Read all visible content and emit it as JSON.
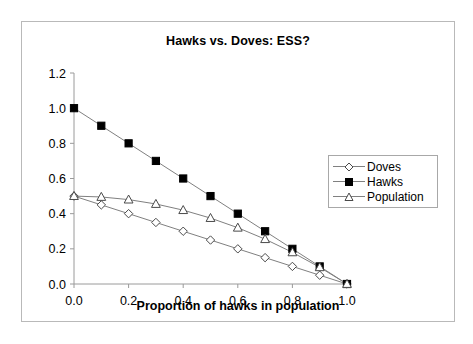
{
  "chart": {
    "title": "Hawks vs. Doves: ESS?",
    "xlabel": "Proportion of hawks in population",
    "ylabel": "",
    "x_ticks": [
      "0.0",
      "0.2",
      "0.4",
      "0.6",
      "0.8",
      "1.0"
    ],
    "y_ticks": [
      "0.0",
      "0.2",
      "0.4",
      "0.6",
      "0.8",
      "1.0",
      "1.2"
    ],
    "legend": {
      "position": "right-middle",
      "entries": [
        {
          "label": "Doves",
          "marker": "open-diamond-icon",
          "color": "#4a4a4a"
        },
        {
          "label": "Hawks",
          "marker": "filled-square-icon",
          "color": "#000000"
        },
        {
          "label": "Population",
          "marker": "open-triangle-icon",
          "color": "#4a4a4a"
        }
      ]
    }
  },
  "chart_data": {
    "type": "line",
    "title": "Hawks vs. Doves: ESS?",
    "xlabel": "Proportion of hawks in population",
    "ylabel": "",
    "xlim": [
      0.0,
      1.0
    ],
    "ylim": [
      0.0,
      1.2
    ],
    "xticks": [
      0.0,
      0.2,
      0.4,
      0.6,
      0.8,
      1.0
    ],
    "yticks": [
      0.0,
      0.2,
      0.4,
      0.6,
      0.8,
      1.0,
      1.2
    ],
    "grid": false,
    "legend_position": "right",
    "x": [
      0.0,
      0.1,
      0.2,
      0.3,
      0.4,
      0.5,
      0.6,
      0.7,
      0.8,
      0.9,
      1.0
    ],
    "series": [
      {
        "name": "Doves",
        "marker": "open-diamond",
        "color": "#4a4a4a",
        "values": [
          0.5,
          0.45,
          0.4,
          0.35,
          0.3,
          0.25,
          0.2,
          0.15,
          0.1,
          0.05,
          0.0
        ]
      },
      {
        "name": "Hawks",
        "marker": "filled-square",
        "color": "#000000",
        "values": [
          1.0,
          0.9,
          0.8,
          0.7,
          0.6,
          0.5,
          0.4,
          0.3,
          0.2,
          0.1,
          0.0
        ]
      },
      {
        "name": "Population",
        "marker": "open-triangle",
        "color": "#4a4a4a",
        "values": [
          0.5,
          0.495,
          0.48,
          0.455,
          0.42,
          0.375,
          0.32,
          0.255,
          0.18,
          0.095,
          0.0
        ]
      }
    ]
  }
}
